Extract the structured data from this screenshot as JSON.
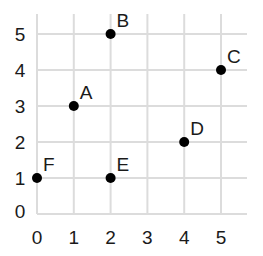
{
  "chart_data": {
    "type": "scatter",
    "title": "",
    "xlabel": "",
    "ylabel": "",
    "xlim": [
      0,
      5
    ],
    "ylim": [
      0,
      5
    ],
    "grid": true,
    "x_ticks": [
      "0",
      "1",
      "2",
      "3",
      "4",
      "5"
    ],
    "y_ticks": [
      "0",
      "1",
      "2",
      "3",
      "4",
      "5"
    ],
    "points": [
      {
        "label": "A",
        "x": 1,
        "y": 3
      },
      {
        "label": "B",
        "x": 2,
        "y": 5
      },
      {
        "label": "C",
        "x": 5,
        "y": 4
      },
      {
        "label": "D",
        "x": 4,
        "y": 2
      },
      {
        "label": "E",
        "x": 2,
        "y": 1
      },
      {
        "label": "F",
        "x": 0,
        "y": 1
      }
    ]
  },
  "colors": {
    "grid": "#dcdcdc",
    "point": "#000000",
    "text": "#1a1a1a",
    "background": "#ffffff"
  }
}
